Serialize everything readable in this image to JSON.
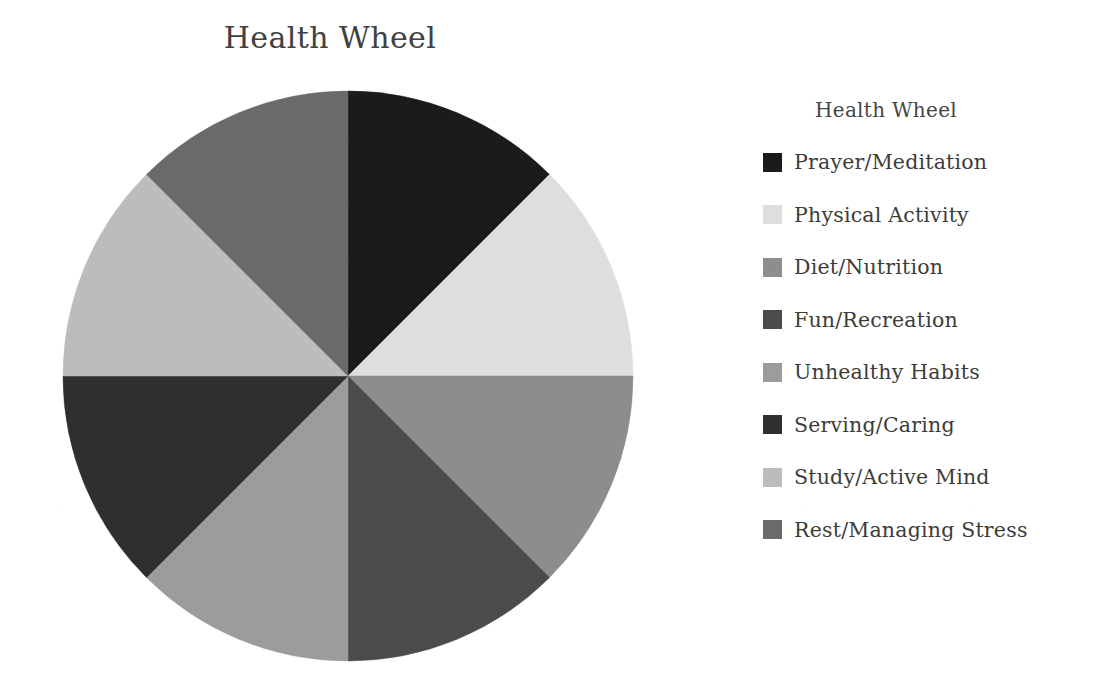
{
  "chart_data": {
    "type": "pie",
    "title": "Health Wheel",
    "legend_title": "Health Wheel",
    "legend_position": "right",
    "xlabel": "",
    "ylabel": "",
    "start_angle_deg": 0,
    "direction": "clockwise",
    "categories": [
      "Prayer/Meditation",
      "Physical Activity",
      "Diet/Nutrition",
      "Fun/Recreation",
      "Unhealthy Habits",
      "Serving/Caring",
      "Study/Active Mind",
      "Rest/Managing Stress"
    ],
    "values": [
      12.5,
      12.5,
      12.5,
      12.5,
      12.5,
      12.5,
      12.5,
      12.5
    ],
    "slices": [
      {
        "label": "Prayer/Meditation",
        "value": 12.5,
        "color": "#1b1b1a",
        "start_deg": 0,
        "end_deg": 45
      },
      {
        "label": "Physical Activity",
        "value": 12.5,
        "color": "#dedede",
        "start_deg": 45,
        "end_deg": 90
      },
      {
        "label": "Diet/Nutrition",
        "value": 12.5,
        "color": "#8d8d8b",
        "start_deg": 90,
        "end_deg": 135
      },
      {
        "label": "Fun/Recreation",
        "value": 12.5,
        "color": "#4b4b4a",
        "start_deg": 135,
        "end_deg": 180
      },
      {
        "label": "Unhealthy Habits",
        "value": 12.5,
        "color": "#9c9c9a",
        "start_deg": 180,
        "end_deg": 225
      },
      {
        "label": "Serving/Caring",
        "value": 12.5,
        "color": "#2f2f2e",
        "start_deg": 225,
        "end_deg": 270
      },
      {
        "label": "Study/Active Mind",
        "value": 12.5,
        "color": "#bcbcba",
        "start_deg": 270,
        "end_deg": 315
      },
      {
        "label": "Rest/Managing Stress",
        "value": 12.5,
        "color": "#6a6a68",
        "start_deg": 315,
        "end_deg": 360
      }
    ]
  },
  "chart": {
    "title": "Health Wheel"
  },
  "legend": {
    "title": "Health Wheel",
    "items": [
      {
        "label": "Prayer/Meditation",
        "color": "#1b1b1a"
      },
      {
        "label": "Physical Activity",
        "color": "#dedede"
      },
      {
        "label": "Diet/Nutrition",
        "color": "#8d8d8b"
      },
      {
        "label": "Fun/Recreation",
        "color": "#4b4b4a"
      },
      {
        "label": "Unhealthy Habits",
        "color": "#9c9c9a"
      },
      {
        "label": "Serving/Caring",
        "color": "#2f2f2e"
      },
      {
        "label": "Study/Active Mind",
        "color": "#bcbcba"
      },
      {
        "label": "Rest/Managing Stress",
        "color": "#6a6a68"
      }
    ]
  },
  "theme": {
    "background": "#ffffff",
    "text_color": "#3c3c38",
    "title_color": "#40403f"
  }
}
